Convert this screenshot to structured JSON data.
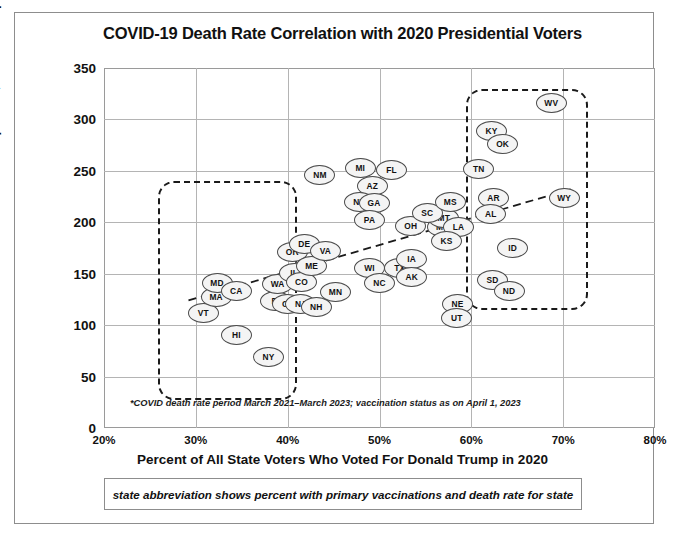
{
  "chart_data": {
    "type": "scatter",
    "title": "COVID-19 Death Rate Correlation with 2020 Presidential Voters",
    "xlabel": "Percent of All State Voters Who Voted For Donald Trump in 2020",
    "ylabel": "Deaths per 100,000 State Population*",
    "xlim": [
      20,
      80
    ],
    "ylim": [
      0,
      350
    ],
    "xticks": [
      "20%",
      "30%",
      "40%",
      "50%",
      "60%",
      "70%",
      "80%"
    ],
    "xtick_values": [
      20,
      30,
      40,
      50,
      60,
      70,
      80
    ],
    "yticks": [
      "0",
      "50",
      "100",
      "150",
      "200",
      "250",
      "300",
      "350"
    ],
    "ytick_values": [
      0,
      50,
      100,
      150,
      200,
      250,
      300,
      350
    ],
    "grid": true,
    "legend": "none",
    "point_label_format": "state abbreviation",
    "footnote": "*COVID death rate period March 2021–March 2023; vaccination status as on April 1, 2023",
    "caption": "state abbreviation shows percent with primary vaccinations and death rate for state",
    "points": [
      {
        "label": "VT",
        "x": 30.7,
        "y": 113
      },
      {
        "label": "MA",
        "x": 32.1,
        "y": 128
      },
      {
        "label": "MD",
        "x": 32.2,
        "y": 142
      },
      {
        "label": "CA",
        "x": 34.3,
        "y": 134
      },
      {
        "label": "HI",
        "x": 34.3,
        "y": 91
      },
      {
        "label": "RI",
        "x": 38.6,
        "y": 124
      },
      {
        "label": "NY",
        "x": 37.8,
        "y": 70
      },
      {
        "label": "WA",
        "x": 38.8,
        "y": 141
      },
      {
        "label": "CT",
        "x": 39.9,
        "y": 122
      },
      {
        "label": "NJ",
        "x": 41.3,
        "y": 122
      },
      {
        "label": "NH",
        "x": 43.0,
        "y": 119
      },
      {
        "label": "IL",
        "x": 40.6,
        "y": 152
      },
      {
        "label": "CO",
        "x": 41.4,
        "y": 143
      },
      {
        "label": "OR",
        "x": 40.4,
        "y": 172
      },
      {
        "label": "DE",
        "x": 41.7,
        "y": 180
      },
      {
        "label": "ME",
        "x": 42.5,
        "y": 158
      },
      {
        "label": "VA",
        "x": 44.0,
        "y": 173
      },
      {
        "label": "MN",
        "x": 45.1,
        "y": 133
      },
      {
        "label": "NM",
        "x": 43.4,
        "y": 247
      },
      {
        "label": "WI",
        "x": 48.8,
        "y": 157
      },
      {
        "label": "NC",
        "x": 49.9,
        "y": 142
      },
      {
        "label": "MI",
        "x": 47.8,
        "y": 254
      },
      {
        "label": "FL",
        "x": 51.2,
        "y": 252
      },
      {
        "label": "AZ",
        "x": 49.1,
        "y": 236
      },
      {
        "label": "NV",
        "x": 47.7,
        "y": 221
      },
      {
        "label": "GA",
        "x": 49.3,
        "y": 220
      },
      {
        "label": "PA",
        "x": 48.8,
        "y": 203
      },
      {
        "label": "TX",
        "x": 52.1,
        "y": 157
      },
      {
        "label": "IA",
        "x": 53.4,
        "y": 165
      },
      {
        "label": "AK",
        "x": 53.4,
        "y": 148
      },
      {
        "label": "OH",
        "x": 53.3,
        "y": 197
      },
      {
        "label": "MO",
        "x": 56.8,
        "y": 196
      },
      {
        "label": "MT",
        "x": 56.9,
        "y": 205
      },
      {
        "label": "SC",
        "x": 55.1,
        "y": 210
      },
      {
        "label": "MS",
        "x": 57.6,
        "y": 221
      },
      {
        "label": "LA",
        "x": 58.5,
        "y": 196
      },
      {
        "label": "KS",
        "x": 57.2,
        "y": 183
      },
      {
        "label": "NE",
        "x": 58.4,
        "y": 122
      },
      {
        "label": "UT",
        "x": 58.3,
        "y": 108
      },
      {
        "label": "TN",
        "x": 60.7,
        "y": 253
      },
      {
        "label": "KY",
        "x": 62.1,
        "y": 290
      },
      {
        "label": "OK",
        "x": 63.3,
        "y": 277
      },
      {
        "label": "AR",
        "x": 62.3,
        "y": 225
      },
      {
        "label": "AL",
        "x": 62.0,
        "y": 209
      },
      {
        "label": "WV",
        "x": 68.6,
        "y": 317
      },
      {
        "label": "WY",
        "x": 70.0,
        "y": 225
      },
      {
        "label": "ID",
        "x": 64.4,
        "y": 176
      },
      {
        "label": "SD",
        "x": 62.2,
        "y": 145
      },
      {
        "label": "ND",
        "x": 64.0,
        "y": 134
      }
    ],
    "trendline": {
      "x0": 29.2,
      "y0": 124,
      "x1": 71.2,
      "y1": 233,
      "style": "dashed"
    },
    "annotations": [
      {
        "name": "left-cluster-highlight",
        "type": "dashed-rounded-box",
        "x0": 25.9,
        "x1": 41.0,
        "y0": 27,
        "y1": 240
      },
      {
        "name": "right-cluster-highlight",
        "type": "dashed-rounded-box",
        "x0": 59.4,
        "x1": 72.7,
        "y0": 115,
        "y1": 330
      }
    ]
  },
  "colors": {
    "background": "#ffffff",
    "frame": "#8d8d8d",
    "axis": "#9a9a9a",
    "gridline": "#b4b4b4",
    "text": "#111111",
    "node_fill": "#f4f4f4",
    "node_stroke": "#4a4a4a",
    "highlight": "#1a1a1a"
  }
}
